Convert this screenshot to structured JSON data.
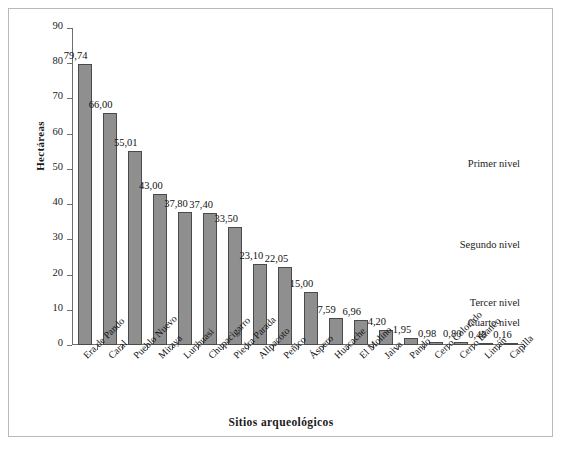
{
  "chart_data": {
    "type": "bar",
    "title": "",
    "xlabel": "Sitios arqueológicos",
    "ylabel": "Hectáreas",
    "ylim": [
      0,
      90
    ],
    "ytick_step": 10,
    "yticks": [
      "0",
      "10",
      "20",
      "30",
      "40",
      "50",
      "60",
      "70",
      "80",
      "90"
    ],
    "grid": false,
    "legend": "none",
    "decimal_separator": ",",
    "bar_color": "#8f8f8f",
    "bar_border_color": "#4a4a4a",
    "categories": [
      "Era de Pando",
      "Caral",
      "Pueblo Nuevo",
      "Miraya",
      "Lurihuasi",
      "Chupacigarro",
      "Piedra Parada",
      "Allpacoto",
      "Peñico",
      "Áspero",
      "Huacache",
      "El Molino",
      "Jaiva",
      "Pando",
      "Cerro Colorado",
      "Cerro Blanco",
      "Limán",
      "Capilla"
    ],
    "values": [
      79.74,
      66.0,
      55.01,
      43.0,
      37.8,
      37.4,
      33.5,
      23.1,
      22.05,
      15.0,
      7.59,
      6.96,
      4.2,
      1.95,
      0.98,
      0.8,
      0.48,
      0.16
    ],
    "value_labels": [
      "79,74",
      "66,00",
      "55,01",
      "43,00",
      "37,80",
      "37,40",
      "33,50",
      "23,10",
      "22,05",
      "15,00",
      "7,59",
      "6,96",
      "4,20",
      "1,95",
      "0,98",
      "0,80",
      "0,48",
      "0,16"
    ],
    "annotations": [
      {
        "text": "Primer nivel",
        "y_value": 51.0
      },
      {
        "text": "Segundo nivel",
        "y_value": 28.0
      },
      {
        "text": "Tercer nivel",
        "y_value": 11.5
      },
      {
        "text": "Cuarto nivel",
        "y_value": 6.0
      }
    ]
  }
}
